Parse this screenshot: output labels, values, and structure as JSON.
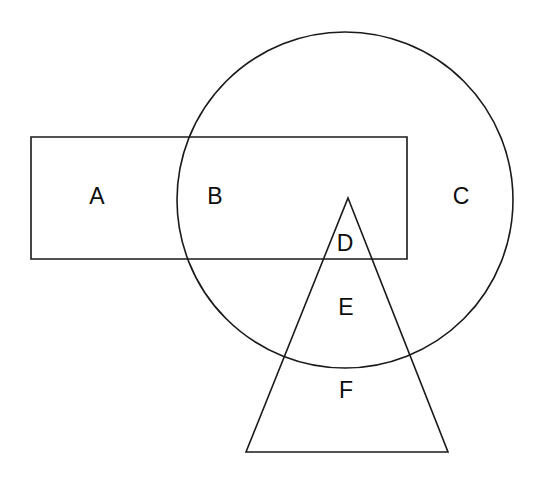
{
  "canvas": {
    "width": 537,
    "height": 477,
    "background": "#ffffff",
    "stroke_color": "#1a1a1a",
    "stroke_width": 1.6,
    "label_color": "#0d0d0d",
    "label_font_size": 23
  },
  "diagram": {
    "type": "venn-like-overlapping-shapes",
    "shapes": [
      {
        "id": "rectangle",
        "kind": "rect",
        "name": "rectangle-shape",
        "x": 31,
        "y": 137,
        "width": 376,
        "height": 122
      },
      {
        "id": "circle",
        "kind": "circle",
        "name": "circle-shape",
        "cx": 345,
        "cy": 200,
        "r": 168
      },
      {
        "id": "triangle",
        "kind": "polygon",
        "name": "triangle-shape",
        "points": "348,198 448,452 246,452"
      }
    ],
    "labels": [
      {
        "id": "A",
        "text": "A",
        "x": 97,
        "y": 196,
        "region": "rectangle-only"
      },
      {
        "id": "B",
        "text": "B",
        "x": 215,
        "y": 196,
        "region": "rectangle-and-circle"
      },
      {
        "id": "C",
        "text": "C",
        "x": 461,
        "y": 196,
        "region": "circle-only"
      },
      {
        "id": "D",
        "text": "D",
        "x": 345,
        "y": 243,
        "region": "rectangle-circle-triangle"
      },
      {
        "id": "E",
        "text": "E",
        "x": 346,
        "y": 307,
        "region": "circle-and-triangle"
      },
      {
        "id": "F",
        "text": "F",
        "x": 346,
        "y": 390,
        "region": "triangle-only"
      }
    ]
  }
}
